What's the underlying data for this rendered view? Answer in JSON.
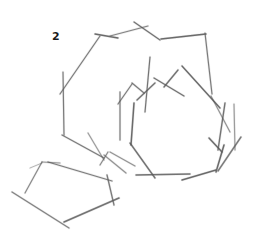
{
  "figure": {
    "label": "2",
    "label_pos": {
      "x": 52,
      "y": 30
    },
    "stroke_color": "#555555",
    "stroke_light": "#9a9a9a",
    "background": "#ffffff"
  },
  "strokes": [
    {
      "group": "outer-hexagon",
      "x1": 95,
      "y1": 34,
      "x2": 118,
      "y2": 38,
      "w": 1.3,
      "o": 0.85
    },
    {
      "group": "outer-hexagon",
      "x1": 100,
      "y1": 36,
      "x2": 60,
      "y2": 94,
      "w": 1.2,
      "o": 0.75
    },
    {
      "group": "outer-hexagon",
      "x1": 110,
      "y1": 36,
      "x2": 148,
      "y2": 26,
      "w": 1.2,
      "o": 0.7
    },
    {
      "group": "outer-hexagon",
      "x1": 134,
      "y1": 22,
      "x2": 160,
      "y2": 40,
      "w": 1.3,
      "o": 0.8
    },
    {
      "group": "outer-hexagon",
      "x1": 161,
      "y1": 39,
      "x2": 206,
      "y2": 34,
      "w": 1.4,
      "o": 0.85
    },
    {
      "group": "outer-hexagon",
      "x1": 205,
      "y1": 33,
      "x2": 212,
      "y2": 94,
      "w": 1.2,
      "o": 0.75
    },
    {
      "group": "outer-hexagon",
      "x1": 63,
      "y1": 72,
      "x2": 64,
      "y2": 135,
      "w": 1.2,
      "o": 0.75
    },
    {
      "group": "outer-hexagon",
      "x1": 62,
      "y1": 135,
      "x2": 104,
      "y2": 158,
      "w": 1.3,
      "o": 0.75
    },
    {
      "group": "outer-hexagon",
      "x1": 150,
      "y1": 57,
      "x2": 145,
      "y2": 112,
      "w": 1.2,
      "o": 0.8
    },
    {
      "group": "outer-hexagon",
      "x1": 211,
      "y1": 96,
      "x2": 230,
      "y2": 132,
      "w": 1.2,
      "o": 0.6
    },
    {
      "group": "inner-crown",
      "x1": 120,
      "y1": 92,
      "x2": 120,
      "y2": 140,
      "w": 1.3,
      "o": 0.7
    },
    {
      "group": "inner-crown",
      "x1": 118,
      "y1": 104,
      "x2": 132,
      "y2": 84,
      "w": 1.2,
      "o": 0.75
    },
    {
      "group": "inner-crown",
      "x1": 132,
      "y1": 83,
      "x2": 144,
      "y2": 93,
      "w": 1.2,
      "o": 0.75
    },
    {
      "group": "inner-crown",
      "x1": 137,
      "y1": 100,
      "x2": 155,
      "y2": 83,
      "w": 1.4,
      "o": 0.8
    },
    {
      "group": "inner-crown",
      "x1": 154,
      "y1": 78,
      "x2": 184,
      "y2": 96,
      "w": 1.4,
      "o": 0.8
    },
    {
      "group": "inner-crown",
      "x1": 164,
      "y1": 87,
      "x2": 178,
      "y2": 70,
      "w": 1.4,
      "o": 0.8
    },
    {
      "group": "inner-crown",
      "x1": 182,
      "y1": 66,
      "x2": 220,
      "y2": 108,
      "w": 1.4,
      "o": 0.85
    },
    {
      "group": "inner-crown",
      "x1": 134,
      "y1": 103,
      "x2": 131,
      "y2": 145,
      "w": 1.5,
      "o": 0.85
    },
    {
      "group": "inner-crown",
      "x1": 130,
      "y1": 143,
      "x2": 155,
      "y2": 178,
      "w": 1.4,
      "o": 0.8
    },
    {
      "group": "inner-crown",
      "x1": 225,
      "y1": 103,
      "x2": 218,
      "y2": 150,
      "w": 1.4,
      "o": 0.8
    },
    {
      "group": "inner-crown",
      "x1": 234,
      "y1": 104,
      "x2": 235,
      "y2": 150,
      "w": 1.2,
      "o": 0.55
    },
    {
      "group": "inner-crown",
      "x1": 209,
      "y1": 138,
      "x2": 222,
      "y2": 152,
      "w": 1.5,
      "o": 0.85
    },
    {
      "group": "inner-crown",
      "x1": 224,
      "y1": 145,
      "x2": 216,
      "y2": 172,
      "w": 1.5,
      "o": 0.85
    },
    {
      "group": "inner-crown",
      "x1": 241,
      "y1": 137,
      "x2": 218,
      "y2": 171,
      "w": 1.4,
      "o": 0.75
    },
    {
      "group": "inner-crown",
      "x1": 136,
      "y1": 175,
      "x2": 190,
      "y2": 174,
      "w": 1.4,
      "o": 0.8
    },
    {
      "group": "inner-crown",
      "x1": 182,
      "y1": 180,
      "x2": 216,
      "y2": 170,
      "w": 1.4,
      "o": 0.85
    },
    {
      "group": "outer-bottom",
      "x1": 88,
      "y1": 133,
      "x2": 104,
      "y2": 160,
      "w": 1.2,
      "o": 0.55
    },
    {
      "group": "outer-bottom",
      "x1": 104,
      "y1": 155,
      "x2": 126,
      "y2": 173,
      "w": 1.2,
      "o": 0.6
    },
    {
      "group": "outer-bottom",
      "x1": 108,
      "y1": 152,
      "x2": 100,
      "y2": 165,
      "w": 1.2,
      "o": 0.65
    },
    {
      "group": "outer-bottom",
      "x1": 110,
      "y1": 152,
      "x2": 135,
      "y2": 166,
      "w": 1.2,
      "o": 0.6
    },
    {
      "group": "pentagon",
      "x1": 42,
      "y1": 162,
      "x2": 60,
      "y2": 163,
      "w": 1.2,
      "o": 0.6
    },
    {
      "group": "pentagon",
      "x1": 30,
      "y1": 168,
      "x2": 42,
      "y2": 163,
      "w": 1.0,
      "o": 0.4
    },
    {
      "group": "pentagon",
      "x1": 42,
      "y1": 162,
      "x2": 25,
      "y2": 193,
      "w": 1.2,
      "o": 0.65
    },
    {
      "group": "pentagon",
      "x1": 48,
      "y1": 162,
      "x2": 112,
      "y2": 181,
      "w": 1.3,
      "o": 0.75
    },
    {
      "group": "pentagon",
      "x1": 107,
      "y1": 175,
      "x2": 114,
      "y2": 205,
      "w": 1.3,
      "o": 0.75
    },
    {
      "group": "pentagon",
      "x1": 119,
      "y1": 198,
      "x2": 64,
      "y2": 222,
      "w": 1.6,
      "o": 0.8
    },
    {
      "group": "pentagon",
      "x1": 12,
      "y1": 192,
      "x2": 69,
      "y2": 228,
      "w": 1.4,
      "o": 0.7
    }
  ]
}
